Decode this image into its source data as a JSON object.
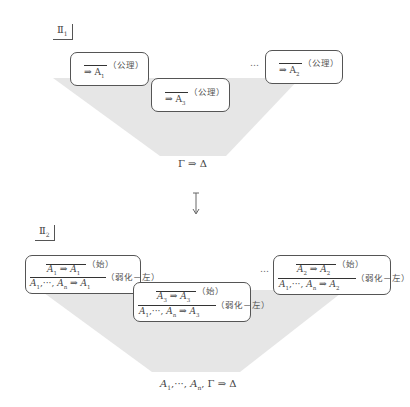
{
  "panel1": {
    "label": "Ⅱ",
    "label_sub": "1",
    "boxes": [
      {
        "sequent": "⇒ A",
        "sub": "1",
        "rule": "（公理）"
      },
      {
        "sequent": "⇒ A",
        "sub": "3",
        "rule": "（公理）"
      },
      {
        "sequent": "⇒ A",
        "sub": "2",
        "rule": "（公理）"
      }
    ],
    "ellipsis": "…",
    "conclusion": "Γ ⇒ Δ"
  },
  "arrow": "↧",
  "panel2": {
    "label": "Ⅱ",
    "label_sub": "2",
    "boxes": [
      {
        "top_left": "A",
        "top_sub_l": "1",
        "top_mid": " ⇒ ",
        "top_right": "A",
        "top_sub_r": "1",
        "top_rule": "（始）",
        "bottom_a": "A",
        "bottom_sub_a": "1",
        "bottom_mid": ",···, ",
        "bottom_b": "A",
        "bottom_sub_b": "n",
        "bottom_arrow": " ⇒ ",
        "bottom_c": "A",
        "bottom_sub_c": "1",
        "bottom_rule": "（弱化－左）"
      },
      {
        "top_left": "A",
        "top_sub_l": "3",
        "top_mid": " ⇒ ",
        "top_right": "A",
        "top_sub_r": "3",
        "top_rule": "（始）",
        "bottom_a": "A",
        "bottom_sub_a": "1",
        "bottom_mid": ",···, ",
        "bottom_b": "A",
        "bottom_sub_b": "n",
        "bottom_arrow": " ⇒ ",
        "bottom_c": "A",
        "bottom_sub_c": "3",
        "bottom_rule": "（弱化－左）"
      },
      {
        "top_left": "A",
        "top_sub_l": "2",
        "top_mid": " ⇒ ",
        "top_right": "A",
        "top_sub_r": "2",
        "top_rule": "（始）",
        "bottom_a": "A",
        "bottom_sub_a": "1",
        "bottom_mid": ",···, ",
        "bottom_b": "A",
        "bottom_sub_b": "n",
        "bottom_arrow": " ⇒ ",
        "bottom_c": "A",
        "bottom_sub_c": "2",
        "bottom_rule": "（弱化－左）"
      }
    ],
    "ellipsis": "…",
    "conclusion": {
      "a": "A",
      "sub_a": "1",
      "mid": ",···, ",
      "b": "A",
      "sub_b": "n",
      "rest": ", Γ ⇒ Δ"
    }
  },
  "colors": {
    "shade": "#e4e4e4",
    "border": "#555555",
    "text": "#444444"
  }
}
